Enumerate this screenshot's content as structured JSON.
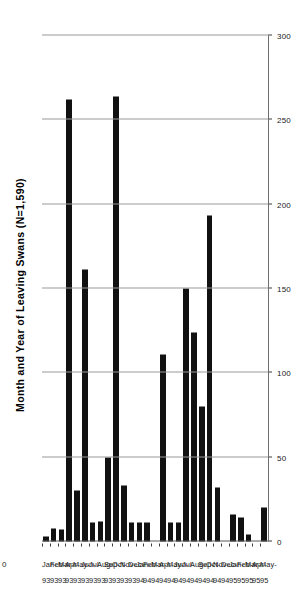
{
  "chart_data": {
    "type": "bar",
    "orientation": "vertical-rotated",
    "title": "Month and Year of Leaving Swans (N=1,590)",
    "subtitle": "",
    "xlabel": "",
    "ylabel": "",
    "ylim": [
      0,
      300
    ],
    "yticks": [
      0,
      50,
      100,
      150,
      200,
      250,
      300
    ],
    "ytick_labels": [
      "0",
      "50",
      "100",
      "150",
      "200",
      "250",
      "300"
    ],
    "grid": true,
    "legend": null,
    "bar_color": "#111111",
    "grid_color": "#9a9a9a",
    "axis_color": "#3d3d3d",
    "n_total": "1,590",
    "categories": [
      "Jan-93",
      "Feb-93",
      "Mar-93",
      "Apr-93",
      "May-93",
      "Jun-93",
      "Jul-93",
      "Aug-93",
      "Sep-93",
      "Oct-93",
      "Nov-93",
      "Dec-93",
      "Jan-94",
      "Feb-94",
      "Mar-94",
      "Apr-94",
      "May-94",
      "Jun-94",
      "Jul-94",
      "Aug-94",
      "Sep-94",
      "Oct-94",
      "Nov-94",
      "Dec-94",
      "Jan-95",
      "Feb-95",
      "Mar-95",
      "Apr-95",
      "May-95"
    ],
    "category_months": [
      "Jan-",
      "Feb-",
      "Mar-",
      "Apr-",
      "May-",
      "Jun-",
      "Jul-",
      "Aug-",
      "Sep-",
      "Oct-",
      "Nov-",
      "Dec-",
      "Jan-",
      "Feb-",
      "Mar-",
      "Apr-",
      "May-",
      "Jun-",
      "Jul-",
      "Aug-",
      "Sep-",
      "Oct-",
      "Nov-",
      "Dec-",
      "Jan-",
      "Feb-",
      "Mar-",
      "Apr-",
      "May-"
    ],
    "category_years": [
      "93",
      "93",
      "93",
      "93",
      "93",
      "93",
      "93",
      "93",
      "93",
      "93",
      "93",
      "93",
      "94",
      "94",
      "94",
      "94",
      "94",
      "94",
      "94",
      "94",
      "94",
      "94",
      "94",
      "94",
      "95",
      "95",
      "95",
      "95",
      "95"
    ],
    "values": [
      3,
      8,
      7,
      262,
      30,
      161,
      11,
      12,
      50,
      264,
      33,
      11,
      11,
      11,
      0,
      111,
      11,
      11,
      150,
      124,
      80,
      193,
      32,
      0,
      16,
      14,
      4,
      0,
      20
    ]
  },
  "axis": {
    "zero_label": "0"
  }
}
